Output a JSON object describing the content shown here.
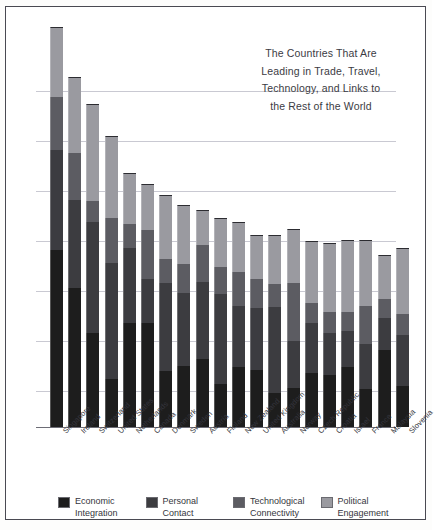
{
  "title": {
    "lines": [
      "The Countries That Are",
      "Leading in Trade, Travel,",
      "Technology, and Links to",
      "the Rest of the World"
    ]
  },
  "legend": {
    "items": [
      {
        "label": "Economic Integration",
        "color": "#1d1d1d"
      },
      {
        "label": "Personal Contact",
        "color": "#3c3c40"
      },
      {
        "label": "Technological Connectivity",
        "color": "#5c5c62"
      },
      {
        "label": "Political Engagement",
        "color": "#9a9aa0"
      }
    ]
  },
  "chart_data": {
    "type": "bar",
    "stacked": true,
    "xlabel": "",
    "ylabel": "",
    "grid": true,
    "legend_position": "bottom",
    "ylim": [
      0,
      406
    ],
    "gridlines": [
      70,
      120,
      170,
      220,
      270,
      320,
      370
    ],
    "categories": [
      "Singapore",
      "Ireland",
      "Switzerland",
      "United States",
      "Netherlands",
      "Canada",
      "Denmark",
      "Sweden",
      "Austria",
      "Finland",
      "New Zealand",
      "United Kingdom",
      "Australia",
      "Norway",
      "Czech Republic",
      "Croatia",
      "Israel",
      "France",
      "Malaysia",
      "Slovenia"
    ],
    "series": [
      {
        "name": "Economic Integration",
        "color": "#1d1d1d",
        "values": [
          177,
          139,
          94,
          48,
          104,
          104,
          56,
          61,
          68,
          43,
          60,
          57,
          34,
          39,
          54,
          52,
          60,
          38,
          77,
          41
        ]
      },
      {
        "name": "Personal Contact",
        "color": "#3c3c40",
        "values": [
          100,
          88,
          111,
          116,
          75,
          44,
          88,
          73,
          77,
          90,
          61,
          62,
          86,
          47,
          50,
          42,
          36,
          45,
          32,
          51
        ]
      },
      {
        "name": "Technological Connectivity",
        "color": "#5c5c62",
        "values": [
          53,
          47,
          21,
          45,
          24,
          49,
          24,
          29,
          37,
          27,
          34,
          29,
          23,
          58,
          20,
          21,
          19,
          38,
          19,
          21
        ]
      },
      {
        "name": "Political Engagement",
        "color": "#9a9aa0",
        "values": [
          70,
          76,
          97,
          82,
          51,
          46,
          64,
          59,
          35,
          49,
          50,
          44,
          49,
          54,
          62,
          69,
          72,
          66,
          44,
          66
        ]
      }
    ],
    "totals": [
      400,
      350,
      323,
      291,
      254,
      243,
      232,
      222,
      217,
      209,
      205,
      192,
      192,
      198,
      186,
      184,
      187,
      187,
      172,
      179
    ]
  },
  "layout": {
    "bar_width": 13,
    "bar_pitch": 18.2,
    "bar_first_x": 14,
    "plot_left": 30,
    "plot_top": 14,
    "plot_width": 360,
    "plot_height": 406
  }
}
